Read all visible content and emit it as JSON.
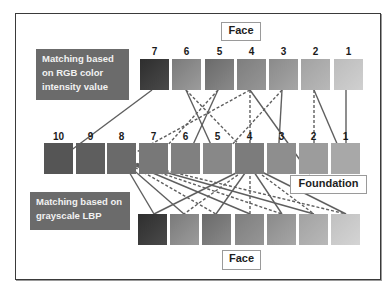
{
  "diagram": {
    "top_tag": "Face",
    "bottom_tag": "Face",
    "middle_tag": "Foundation",
    "rgb_label": [
      "Matching based",
      "on RGB color",
      "intensity value"
    ],
    "lbp_label": [
      "Matching based on",
      "grayscale LBP"
    ],
    "top_row": {
      "name": "Face",
      "labels": [
        "7",
        "6",
        "5",
        "4",
        "3",
        "2",
        "1"
      ],
      "colors": [
        "#3a3a3a",
        "#8c8c8c",
        "#7a7a7a",
        "#8a8a8a",
        "#989898",
        "#acacac",
        "#c4c4c4"
      ]
    },
    "middle_row": {
      "name": "Foundation",
      "labels": [
        "10",
        "9",
        "8",
        "7",
        "6",
        "5",
        "4",
        "3",
        "2",
        "1"
      ],
      "colors": [
        "#555555",
        "#5e5e5e",
        "#6a6a6a",
        "#787878",
        "#808080",
        "#888888",
        "#7c7c7c",
        "#8e8e8e",
        "#9c9c9c",
        "#a8a8a8"
      ]
    },
    "bottom_row": {
      "name": "Face",
      "labels": [
        "",
        "",
        "",
        "",
        "",
        "",
        ""
      ],
      "colors": [
        "#3a3a3a",
        "#8a8a8a",
        "#7a7a7a",
        "#8a8a8a",
        "#989898",
        "#acacac",
        "#c8c8c8"
      ]
    },
    "line_color": "#5f5f5f"
  }
}
